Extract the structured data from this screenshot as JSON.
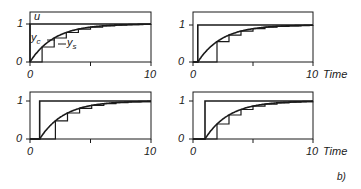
{
  "figure": {
    "label": "b)",
    "x_axis_name": "Time",
    "ink_color": "#1a1a1a",
    "background": "#ffffff"
  },
  "chart_data": [
    {
      "type": "line",
      "panel": "top-left",
      "xlim": [
        0,
        10
      ],
      "ylim": [
        0,
        1
      ],
      "xticks": [
        0,
        5,
        10
      ],
      "xtick_labels": [
        "0",
        "",
        "10"
      ],
      "yticks": [
        0,
        1
      ],
      "ytick_labels": [
        "0",
        "1"
      ],
      "xlabel": "",
      "annotations": [
        "u",
        "y_c",
        "y_s"
      ],
      "input_step_time": 0,
      "sample_start": 1.0,
      "sample_period": 1.0,
      "time_constant": 2.0,
      "series": [
        {
          "name": "u",
          "description": "unit step input"
        },
        {
          "name": "y_c",
          "description": "continuous response 1-exp(-(t-t0)/T)"
        },
        {
          "name": "y_s",
          "description": "sampled-and-held response (staircase)"
        }
      ]
    },
    {
      "type": "line",
      "panel": "top-right",
      "xlim": [
        0,
        10
      ],
      "ylim": [
        0,
        1
      ],
      "xticks": [
        0,
        5,
        10
      ],
      "xtick_labels": [
        "0",
        "",
        "10"
      ],
      "yticks": [
        0,
        1
      ],
      "ytick_labels": [
        "0",
        "1"
      ],
      "xlabel": "Time",
      "input_step_time": 0.4,
      "sample_start": 2.0,
      "sample_period": 1.0,
      "time_constant": 2.0,
      "series": [
        {
          "name": "u"
        },
        {
          "name": "y_c"
        },
        {
          "name": "y_s"
        }
      ]
    },
    {
      "type": "line",
      "panel": "bottom-left",
      "xlim": [
        0,
        10
      ],
      "ylim": [
        0,
        1
      ],
      "xticks": [
        0,
        5,
        10
      ],
      "xtick_labels": [
        "0",
        "",
        "10"
      ],
      "yticks": [
        0,
        1
      ],
      "ytick_labels": [
        "0",
        "1"
      ],
      "xlabel": "",
      "input_step_time": 0.8,
      "sample_start": 2.1,
      "sample_period": 1.0,
      "time_constant": 2.0,
      "series": [
        {
          "name": "u"
        },
        {
          "name": "y_c"
        },
        {
          "name": "y_s"
        }
      ]
    },
    {
      "type": "line",
      "panel": "bottom-right",
      "xlim": [
        0,
        10
      ],
      "ylim": [
        0,
        1
      ],
      "xticks": [
        0,
        5,
        10
      ],
      "xtick_labels": [
        "0",
        "",
        "10"
      ],
      "yticks": [
        0,
        1
      ],
      "ytick_labels": [
        "0",
        "1"
      ],
      "xlabel": "Time",
      "input_step_time": 1.0,
      "sample_start": 2.0,
      "sample_period": 1.0,
      "time_constant": 2.0,
      "series": [
        {
          "name": "u"
        },
        {
          "name": "y_c"
        },
        {
          "name": "y_s"
        }
      ]
    }
  ],
  "panels": [
    {
      "x0": 30,
      "x10": 151,
      "y0": 62,
      "y1": 24,
      "top": 12,
      "labels": {
        "y1": "1",
        "y0": "0",
        "x0": "0",
        "x10": "10",
        "time": ""
      }
    },
    {
      "x0": 193,
      "x10": 313,
      "y0": 62,
      "y1": 25,
      "top": 12,
      "labels": {
        "y1": "1",
        "y0": "0",
        "x0": "0",
        "x10": "10",
        "time": "Time"
      }
    },
    {
      "x0": 30,
      "x10": 151,
      "y0": 139,
      "y1": 101,
      "top": 92,
      "labels": {
        "y1": "1",
        "y0": "0",
        "x0": "0",
        "x10": "10",
        "time": ""
      }
    },
    {
      "x0": 193,
      "x10": 313,
      "y0": 139,
      "y1": 101,
      "top": 92,
      "labels": {
        "y1": "1",
        "y0": "0",
        "x0": "0",
        "x10": "10",
        "time": "Time"
      }
    }
  ],
  "annotations": {
    "u": "u",
    "yc": "y",
    "yc_sub": "c",
    "ys": "y",
    "ys_sub": "s"
  }
}
